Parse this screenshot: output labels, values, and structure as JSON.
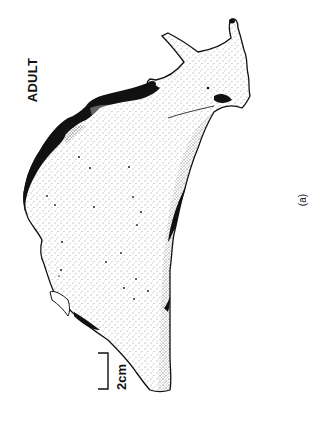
{
  "figure": {
    "stage_label": "ADULT",
    "scale_bar_label": "2cm",
    "panel_label": "(a)",
    "colors": {
      "ink": "#111111",
      "background": "#ffffff"
    }
  }
}
